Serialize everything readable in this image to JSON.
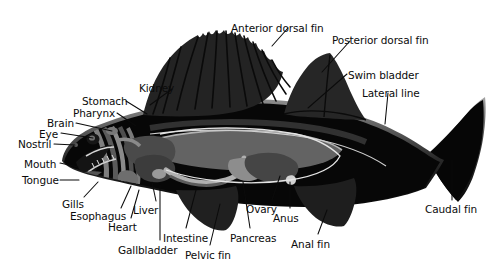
{
  "diagram": {
    "background_color": "#ffffff",
    "ink_color": "#0b0b0b",
    "body_color": "#050505",
    "fin_color": "#242424",
    "organ_grays": [
      "#3a3a3a",
      "#585858",
      "#767676",
      "#8e8e8e",
      "#a8a8a8",
      "#c9c9c9"
    ],
    "label_count": 22
  },
  "labels": [
    {
      "id": "anterior-dorsal-fin",
      "text": "Anterior dorsal fin",
      "x": 231,
      "y": 23,
      "align": "left",
      "leader": [
        [
          288,
          28
        ],
        [
          272,
          46
        ]
      ]
    },
    {
      "id": "posterior-dorsal-fin",
      "text": "Posterior dorsal fin",
      "x": 332,
      "y": 35,
      "align": "left",
      "leader": [
        [
          350,
          41
        ],
        [
          322,
          72
        ]
      ]
    },
    {
      "id": "swim-bladder",
      "text": "Swim bladder",
      "x": 348,
      "y": 70,
      "align": "left",
      "leader": [
        [
          347,
          74
        ],
        [
          308,
          108
        ]
      ]
    },
    {
      "id": "lateral-line",
      "text": "Lateral line",
      "x": 362,
      "y": 88,
      "align": "left",
      "leader": [
        [
          388,
          93
        ],
        [
          385,
          124
        ]
      ]
    },
    {
      "id": "kidney",
      "text": "Kidney",
      "x": 139,
      "y": 83,
      "align": "left",
      "leader": [
        [
          172,
          89
        ],
        [
          150,
          105
        ]
      ]
    },
    {
      "id": "stomach",
      "text": "Stomach",
      "x": 82,
      "y": 96,
      "align": "left",
      "leader": [
        [
          126,
          101
        ],
        [
          147,
          114
        ]
      ]
    },
    {
      "id": "pharynx",
      "text": "Pharynx",
      "x": 73,
      "y": 108,
      "align": "left",
      "leader": [
        [
          117,
          113
        ],
        [
          136,
          126
        ]
      ]
    },
    {
      "id": "brain",
      "text": "Brain",
      "x": 47,
      "y": 118,
      "align": "left",
      "leader": [
        [
          76,
          123
        ],
        [
          112,
          131
        ]
      ]
    },
    {
      "id": "eye",
      "text": "Eye",
      "x": 39,
      "y": 129,
      "align": "left",
      "leader": [
        [
          61,
          133
        ],
        [
          93,
          138
        ]
      ]
    },
    {
      "id": "nostril",
      "text": "Nostril",
      "x": 18,
      "y": 139,
      "align": "left",
      "leader": [
        [
          54,
          144
        ],
        [
          75,
          145
        ]
      ]
    },
    {
      "id": "mouth",
      "text": "Mouth",
      "x": 24,
      "y": 159,
      "align": "left",
      "leader": [
        [
          60,
          163
        ],
        [
          78,
          167
        ]
      ]
    },
    {
      "id": "tongue",
      "text": "Tongue",
      "x": 22,
      "y": 175,
      "align": "left",
      "leader": [
        [
          60,
          180
        ],
        [
          79,
          180
        ]
      ]
    },
    {
      "id": "gills",
      "text": "Gills",
      "x": 62,
      "y": 199,
      "align": "left",
      "leader": [
        [
          84,
          197
        ],
        [
          98,
          182
        ]
      ]
    },
    {
      "id": "esophagus",
      "text": "Esophagus",
      "x": 70,
      "y": 211,
      "align": "left",
      "leader": [
        [
          121,
          208
        ],
        [
          131,
          186
        ]
      ]
    },
    {
      "id": "heart",
      "text": "Heart",
      "x": 108,
      "y": 222,
      "align": "left",
      "leader": [
        [
          131,
          218
        ],
        [
          139,
          190
        ]
      ]
    },
    {
      "id": "liver",
      "text": "Liver",
      "x": 133,
      "y": 205,
      "align": "left",
      "leader": [
        [
          156,
          201
        ],
        [
          152,
          182
        ]
      ]
    },
    {
      "id": "gallbladder",
      "text": "Gallbladder",
      "x": 118,
      "y": 245,
      "align": "left",
      "leader": [
        [
          160,
          240
        ],
        [
          160,
          185
        ]
      ]
    },
    {
      "id": "intestine",
      "text": "Intestine",
      "x": 163,
      "y": 233,
      "align": "left",
      "leader": [
        [
          186,
          228
        ],
        [
          196,
          190
        ]
      ]
    },
    {
      "id": "pelvic-fin",
      "text": "Pelvic fin",
      "x": 185,
      "y": 250,
      "align": "left",
      "leader": [
        [
          210,
          245
        ],
        [
          220,
          204
        ]
      ]
    },
    {
      "id": "pancreas",
      "text": "Pancreas",
      "x": 230,
      "y": 233,
      "align": "left",
      "leader": [
        [
          250,
          228
        ],
        [
          243,
          182
        ]
      ]
    },
    {
      "id": "ovary",
      "text": "Ovary",
      "x": 246,
      "y": 204,
      "align": "left",
      "leader": [
        [
          272,
          200
        ],
        [
          280,
          176
        ]
      ]
    },
    {
      "id": "anus",
      "text": "Anus",
      "x": 273,
      "y": 213,
      "align": "left",
      "leader": [
        [
          290,
          208
        ],
        [
          290,
          182
        ]
      ]
    },
    {
      "id": "anal-fin",
      "text": "Anal fin",
      "x": 291,
      "y": 239,
      "align": "left",
      "leader": [
        [
          318,
          234
        ],
        [
          327,
          210
        ]
      ]
    },
    {
      "id": "caudal-fin",
      "text": "Caudal fin",
      "x": 425,
      "y": 204,
      "align": "left",
      "leader": [
        [
          452,
          200
        ],
        [
          452,
          160
        ]
      ]
    }
  ]
}
